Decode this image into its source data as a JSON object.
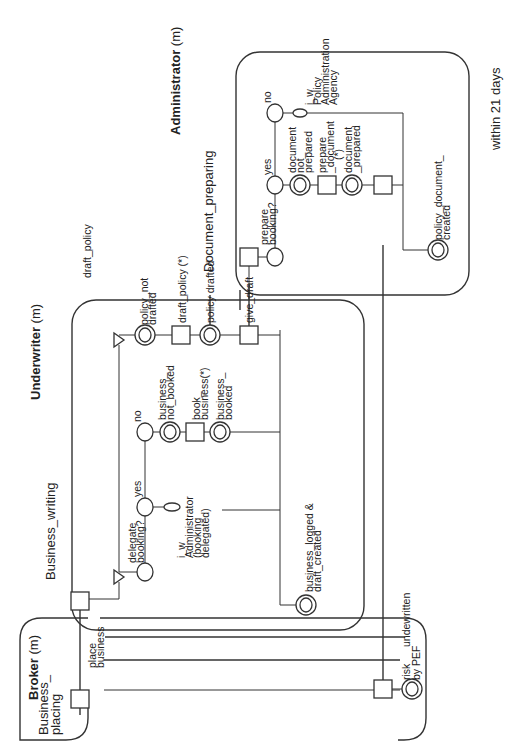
{
  "title": "draft_policy",
  "timing": "within 21 days",
  "lanes": {
    "broker": {
      "role": "Broker",
      "mult": " (m)",
      "process_line1": "Business_",
      "process_line2": "placing"
    },
    "underwriter": {
      "role": "Underwriter",
      "mult": " (m)",
      "process": "Business_writing"
    },
    "administrator": {
      "role": "Administrator",
      "mult": " (m)",
      "process": "Document_preparing"
    }
  },
  "broker": {
    "place_business_1": "place",
    "place_business_2": "business",
    "risk_1": "risk",
    "risk_2": "by PEF",
    "risk_3": "undewritten"
  },
  "underwriter": {
    "delegate_1": "delegate",
    "delegate_2": "booking?",
    "yes": "yes",
    "no": "no",
    "iw_1": "i_w",
    "iw_2": "Administrator",
    "iw_3": "(booking",
    "iw_4": "delegated)",
    "bnb_1": "business_",
    "bnb_2": "not_booked",
    "book_1": "book_",
    "book_2": "business(*)",
    "bb_1": "business_",
    "bb_2": "booked",
    "pnd_1": "policy_not",
    "pnd_2": "drafted",
    "draft_policy": "draft_policy (*)",
    "policy_drafted": "policy drafted",
    "give_draft": "give_draft",
    "bldc_1": "business_logged &",
    "bldc_2": "draft_created"
  },
  "administrator": {
    "prepare_1": "prepare",
    "prepare_2": "booking?",
    "yes": "yes",
    "no": "no",
    "iw_1": "i_w",
    "iw_2": "Policy",
    "iw_3": "Administration",
    "iw_4": "Agency",
    "dnp_1": "document",
    "dnp_2": "not_",
    "dnp_3": "prepared",
    "pd_1": "prepare",
    "pd_2": "_document",
    "pd_3": "(*)",
    "dp_1": "document",
    "dp_2": "_prepared",
    "pdc_1": "policy_document_",
    "pdc_2": "created"
  }
}
